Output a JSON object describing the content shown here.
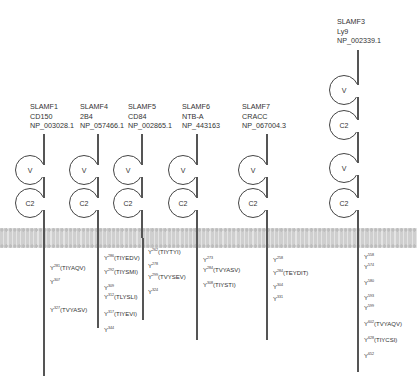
{
  "receptors": [
    {
      "name": "SLAMF1",
      "alias": "CD150",
      "accession": "NP_003028.1",
      "domains": [
        "V",
        "C2"
      ],
      "tyrosines": [
        {
          "pos": "281",
          "motif": "(TIYAQV)"
        },
        {
          "pos": "307",
          "motif": ""
        },
        {
          "pos": "327",
          "motif": "(TVYASV)"
        }
      ]
    },
    {
      "name": "SLAMF4",
      "alias": "2B4",
      "accession": "NP_057466.1",
      "domains": [
        "V",
        "C2"
      ],
      "tyrosines": [
        {
          "pos": "286",
          "motif": "(TIYEDV)"
        },
        {
          "pos": "292",
          "motif": "(TIYSMI)"
        },
        {
          "pos": "309",
          "motif": ""
        },
        {
          "pos": "312",
          "motif": "(TLYSLI)"
        },
        {
          "pos": "317",
          "motif": "(TIYEVI)"
        },
        {
          "pos": "344",
          "motif": ""
        }
      ]
    },
    {
      "name": "SLAMF5",
      "alias": "CD84",
      "accession": "NP_002865.1",
      "domains": [
        "V",
        "C2"
      ],
      "tyrosines": [
        {
          "pos": "262",
          "motif": "(TIYTYI)"
        },
        {
          "pos": "278",
          "motif": ""
        },
        {
          "pos": "299",
          "motif": "(TVYSEV)"
        },
        {
          "pos": "324",
          "motif": ""
        }
      ]
    },
    {
      "name": "SLAMF6",
      "alias": "NTB-A",
      "accession": "NP_443163",
      "domains": [
        "V",
        "C2"
      ],
      "tyrosines": [
        {
          "pos": "273",
          "motif": ""
        },
        {
          "pos": "284",
          "motif": "(TVYASV)"
        },
        {
          "pos": "308",
          "motif": "(TIYSTI)"
        }
      ]
    },
    {
      "name": "SLAMF7",
      "alias": "CRACC",
      "accession": "NP_067004.3",
      "domains": [
        "V",
        "C2"
      ],
      "tyrosines": [
        {
          "pos": "258",
          "motif": ""
        },
        {
          "pos": "284",
          "motif": "(TEYDIT)"
        },
        {
          "pos": "304",
          "motif": ""
        },
        {
          "pos": "331",
          "motif": ""
        }
      ]
    },
    {
      "name": "SLAMF3",
      "alias": "Ly9",
      "accession": "NP_002339.1",
      "domains": [
        "V",
        "C2",
        "V",
        "C2"
      ],
      "tyrosines": [
        {
          "pos": "558",
          "motif": ""
        },
        {
          "pos": "574",
          "motif": ""
        },
        {
          "pos": "580",
          "motif": ""
        },
        {
          "pos": "593",
          "motif": ""
        },
        {
          "pos": "599",
          "motif": ""
        },
        {
          "pos": "602",
          "motif": "(TVYAQV)"
        },
        {
          "pos": "628",
          "motif": "(TIYCSI)"
        },
        {
          "pos": "652",
          "motif": ""
        }
      ]
    }
  ],
  "colors": {
    "line": "#555555",
    "membrane": "#cfcfcf",
    "text": "#333333"
  }
}
